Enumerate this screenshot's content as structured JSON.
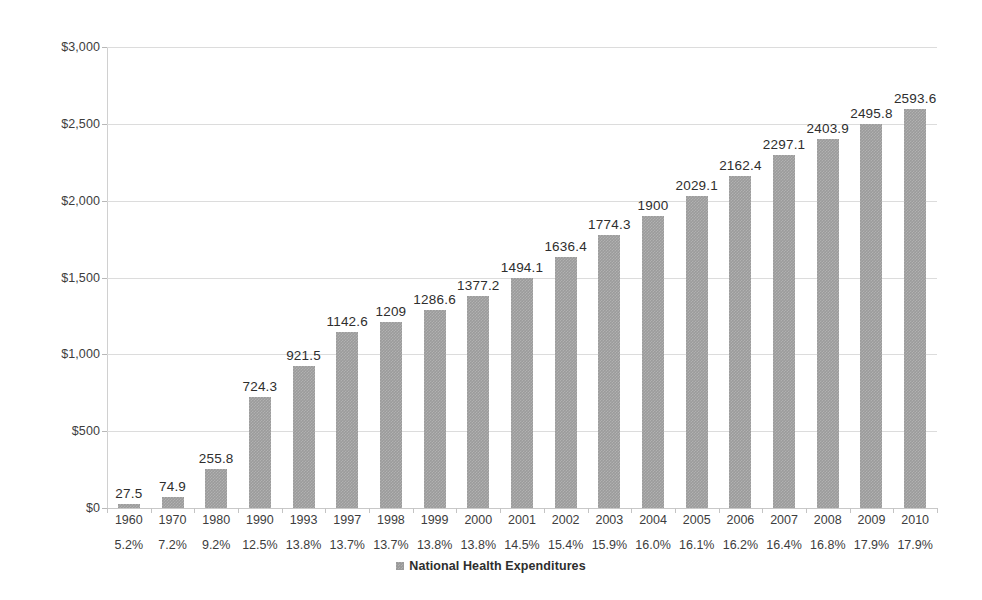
{
  "chart_data": {
    "type": "bar",
    "title": "",
    "xlabel": "",
    "ylabel": "",
    "ylim": [
      0,
      3000
    ],
    "grid": true,
    "legend_position": "bottom-center",
    "series_name": "National Health Expenditures",
    "series_color": "#9b9b9b",
    "y_ticks": [
      "$0",
      "$500",
      "$1,000",
      "$1,500",
      "$2,000",
      "$2,500",
      "$3,000"
    ],
    "y_tick_values": [
      0,
      500,
      1000,
      1500,
      2000,
      2500,
      3000
    ],
    "categories": [
      "1960",
      "1970",
      "1980",
      "1990",
      "1993",
      "1997",
      "1998",
      "1999",
      "2000",
      "2001",
      "2002",
      "2003",
      "2004",
      "2005",
      "2006",
      "2007",
      "2008",
      "2009",
      "2010"
    ],
    "secondary_categories": [
      "5.2%",
      "7.2%",
      "9.2%",
      "12.5%",
      "13.8%",
      "13.7%",
      "13.7%",
      "13.8%",
      "13.8%",
      "14.5%",
      "15.4%",
      "15.9%",
      "16.0%",
      "16.1%",
      "16.2%",
      "16.4%",
      "16.8%",
      "17.9%",
      "17.9%"
    ],
    "values": [
      27.5,
      74.9,
      255.8,
      724.3,
      921.5,
      1142.6,
      1209,
      1286.6,
      1377.2,
      1494.1,
      1636.4,
      1774.3,
      1900,
      2029.1,
      2162.4,
      2297.1,
      2403.9,
      2495.8,
      2593.6
    ],
    "value_labels": [
      "27.5",
      "74.9",
      "255.8",
      "724.3",
      "921.5",
      "1142.6",
      "1209",
      "1286.6",
      "1377.2",
      "1494.1",
      "1636.4",
      "1774.3",
      "1900",
      "2029.1",
      "2162.4",
      "2297.1",
      "2403.9",
      "2495.8",
      "2593.6"
    ]
  },
  "legend": {
    "items": [
      {
        "label": "National Health Expenditures",
        "color": "#9b9b9b"
      }
    ]
  }
}
